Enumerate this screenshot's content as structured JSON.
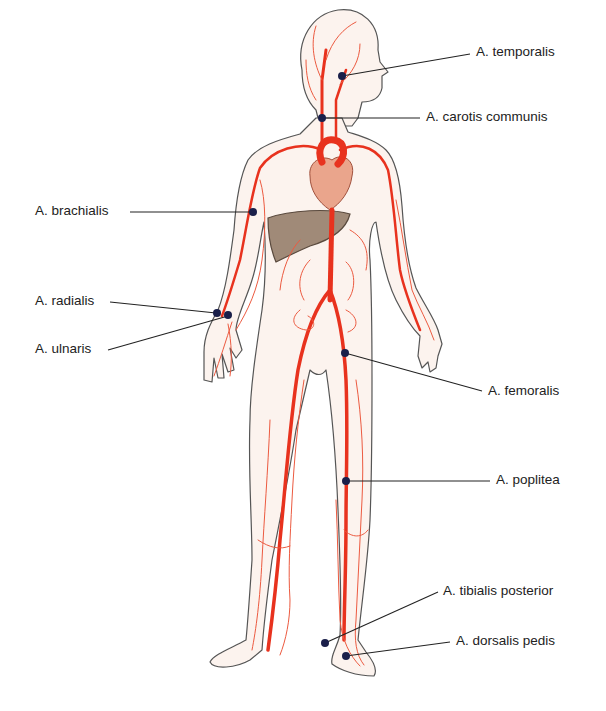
{
  "diagram": {
    "colors": {
      "artery": "#e8321e",
      "artery_thin": "#ec5a40",
      "body_fill": "#fcf3ee",
      "body_outline": "#555555",
      "heart": "#eaa58c",
      "liver": "#a08a78",
      "marker": "#1a1f4a",
      "leader_line": "#222222"
    },
    "labels": [
      {
        "id": "temporalis",
        "text": "A. temporalis",
        "side": "right"
      },
      {
        "id": "carotis",
        "text": "A. carotis communis",
        "side": "right"
      },
      {
        "id": "brachialis",
        "text": "A. brachialis",
        "side": "left"
      },
      {
        "id": "radialis",
        "text": "A. radialis",
        "side": "left"
      },
      {
        "id": "ulnaris",
        "text": "A. ulnaris",
        "side": "left"
      },
      {
        "id": "femoralis",
        "text": "A. femoralis",
        "side": "right"
      },
      {
        "id": "poplitea",
        "text": "A. poplitea",
        "side": "right"
      },
      {
        "id": "tibialis",
        "text": "A. tibialis posterior",
        "side": "right"
      },
      {
        "id": "dorsalis",
        "text": "A. dorsalis pedis",
        "side": "right"
      }
    ]
  }
}
